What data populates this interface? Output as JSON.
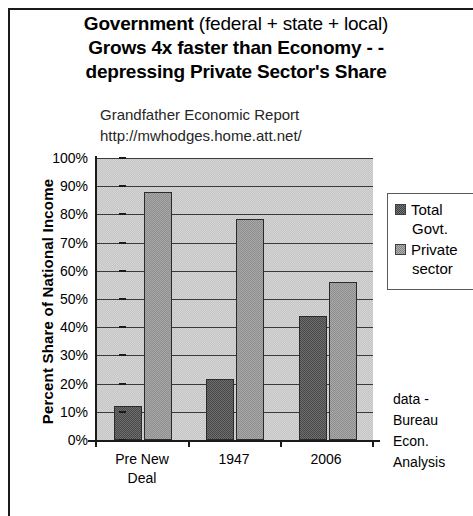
{
  "title": {
    "line1_bold": "Government",
    "line1_rest": " (federal + state + local)",
    "line2": "Grows 4x faster than Economy - -",
    "line3": "depressing Private Sector's Share"
  },
  "subtitle": {
    "line1": "Grandfather Economic Report",
    "line2": "http://mwhodges.home.att.net/"
  },
  "legend": {
    "entry1_line1": "Total",
    "entry1_line2": "Govt.",
    "entry2_line1": "Private",
    "entry2_line2": "sector"
  },
  "source": {
    "line1": "data -",
    "line2": "Bureau",
    "line3": "Econ.",
    "line4": "Analysis"
  },
  "axis": {
    "y_title": "Percent Share of National Income",
    "ticks": [
      "100%",
      "90%",
      "80%",
      "70%",
      "60%",
      "50%",
      "40%",
      "30%",
      "20%",
      "10%",
      "0%"
    ]
  },
  "x_labels": {
    "cat0_line1": "Pre New",
    "cat0_line2": "Deal",
    "cat1_line1": "1947",
    "cat1_line2": "",
    "cat2_line1": "2006",
    "cat2_line2": ""
  },
  "chart_data": {
    "type": "bar",
    "title": "Government (federal + state + local) Grows 4x faster than Economy - - depressing Private Sector's Share",
    "subtitle": "Grandfather Economic Report  http://mwhodges.home.att.net/",
    "categories": [
      "Pre New Deal",
      "1947",
      "2006"
    ],
    "series": [
      {
        "name": "Total Govt.",
        "values": [
          12,
          21.5,
          44
        ],
        "color": "#5a5a5a"
      },
      {
        "name": "Private sector",
        "values": [
          88,
          78.5,
          56
        ],
        "color": "#9a9a9a"
      }
    ],
    "xlabel": "",
    "ylabel": "Percent Share of National Income",
    "ylim": [
      0,
      100
    ],
    "ytick_step": 10,
    "ytick_format": "percent",
    "grid": true,
    "legend_position": "right",
    "annotations": [
      "data - Bureau Econ. Analysis"
    ]
  }
}
